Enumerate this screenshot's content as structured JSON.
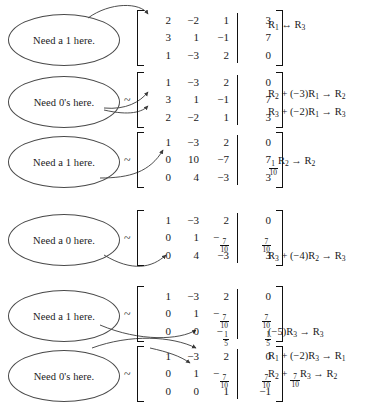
{
  "document": {
    "title": "Row reduction worked example",
    "tilde": "~"
  },
  "steps": [
    {
      "callout": "Need a 1 here.",
      "tilde": "",
      "matrix": [
        [
          "2",
          "-2",
          "1",
          "3"
        ],
        [
          "3",
          "1",
          "-1",
          "7"
        ],
        [
          "1",
          "-3",
          "2",
          "0"
        ]
      ],
      "operations": [
        "R1 ↔ R3"
      ],
      "operations_parts": [
        {
          "pre": "R",
          "sub1": "1",
          "mid": " ↔ R",
          "sub2": "3",
          "post": ""
        }
      ]
    },
    {
      "callout": "Need 0's here.",
      "tilde": "~",
      "matrix": [
        [
          "1",
          "-3",
          "2",
          "0"
        ],
        [
          "3",
          "1",
          "-1",
          "7"
        ],
        [
          "2",
          "-2",
          "1",
          "3"
        ]
      ],
      "operations": [
        "R2 + (-3)R1 → R2",
        "R3 + (-2)R1 → R3"
      ]
    },
    {
      "callout": "Need a 1 here.",
      "tilde": "~",
      "matrix": [
        [
          "1",
          "-3",
          "2",
          "0"
        ],
        [
          "0",
          "10",
          "-7",
          "7"
        ],
        [
          "0",
          "4",
          "-3",
          "3"
        ]
      ],
      "operations": [
        "(1/10)R2 → R2"
      ]
    },
    {
      "callout": "Need a 0 here.",
      "tilde": "~",
      "matrix": [
        [
          "1",
          "-3",
          "2",
          "0"
        ],
        [
          "0",
          "1",
          "-7/10",
          "7/10"
        ],
        [
          "0",
          "4",
          "-3",
          "3"
        ]
      ],
      "operations": [
        "R3 + (-4)R2 → R3"
      ]
    },
    {
      "callout": "Need a 1 here.",
      "tilde": "~",
      "matrix": [
        [
          "1",
          "-3",
          "2",
          "0"
        ],
        [
          "0",
          "1",
          "-7/10",
          "7/10"
        ],
        [
          "0",
          "0",
          "-1/5",
          "1/5"
        ]
      ],
      "operations": [
        "(-5)R3 → R3"
      ]
    },
    {
      "callout": "Need 0's here.",
      "tilde": "~",
      "matrix": [
        [
          "1",
          "-3",
          "2",
          "0"
        ],
        [
          "0",
          "1",
          "-7/10",
          "7/10"
        ],
        [
          "0",
          "0",
          "1",
          "-1"
        ]
      ],
      "operations": [
        "R1 + (-2)R3 → R1",
        "R2 + (7/10)R3 → R2"
      ]
    }
  ],
  "colors": {
    "ink": "#1a1a1a",
    "rule": "#111111",
    "ellipse_stroke": "#4a4a4a",
    "arrow_stroke": "#3a3a3a",
    "background": "#ffffff"
  }
}
